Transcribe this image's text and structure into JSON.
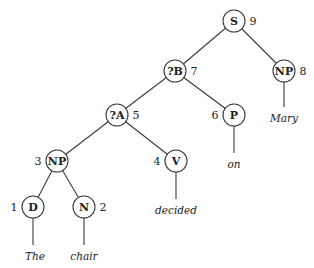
{
  "diagram": {
    "type": "parse-tree",
    "nodes": [
      {
        "id": "S",
        "label": "S",
        "num": "9",
        "x": 234,
        "y": 21,
        "num_side": "right"
      },
      {
        "id": "NP8",
        "label": "NP",
        "num": "8",
        "x": 284,
        "y": 71,
        "num_side": "right"
      },
      {
        "id": "B",
        "label": "?B",
        "num": "7",
        "x": 175,
        "y": 71,
        "num_side": "right"
      },
      {
        "id": "A",
        "label": "?A",
        "num": "5",
        "x": 117,
        "y": 115,
        "num_side": "right"
      },
      {
        "id": "P",
        "label": "P",
        "num": "6",
        "x": 234,
        "y": 115,
        "num_side": "left"
      },
      {
        "id": "NP3",
        "label": "NP",
        "num": "3",
        "x": 57,
        "y": 161,
        "num_side": "left"
      },
      {
        "id": "V",
        "label": "V",
        "num": "4",
        "x": 176,
        "y": 161,
        "num_side": "left"
      },
      {
        "id": "D",
        "label": "D",
        "num": "1",
        "x": 33,
        "y": 207,
        "num_side": "left"
      },
      {
        "id": "N",
        "label": "N",
        "num": "2",
        "x": 84,
        "y": 207,
        "num_side": "right"
      }
    ],
    "leaves": [
      {
        "id": "w_mary",
        "text": "Mary",
        "parent": "NP8",
        "x": 284,
        "y": 118
      },
      {
        "id": "w_on",
        "text": "on",
        "parent": "P",
        "x": 234,
        "y": 164
      },
      {
        "id": "w_decided",
        "text": "decided",
        "parent": "V",
        "x": 176,
        "y": 210
      },
      {
        "id": "w_the",
        "text": "The",
        "parent": "D",
        "x": 35,
        "y": 256
      },
      {
        "id": "w_chair",
        "text": "chair",
        "parent": "N",
        "x": 84,
        "y": 256
      }
    ],
    "edges": [
      [
        "S",
        "B"
      ],
      [
        "S",
        "NP8"
      ],
      [
        "B",
        "A"
      ],
      [
        "B",
        "P"
      ],
      [
        "A",
        "NP3"
      ],
      [
        "A",
        "V"
      ],
      [
        "NP3",
        "D"
      ],
      [
        "NP3",
        "N"
      ]
    ],
    "node_radius": 11
  }
}
